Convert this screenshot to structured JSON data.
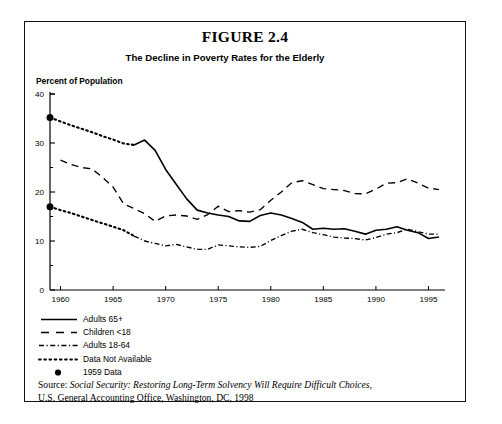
{
  "figure": {
    "title": "FIGURE 2.4",
    "subtitle": "The Decline in Poverty Rates for the Elderly",
    "y_axis_label": "Percent of Population"
  },
  "source": {
    "prefix": "Source: ",
    "italic_title": "Social Security: Restoring Long-Term Solvency Will Require Difficult Choices",
    "tail": ",",
    "line2": "U.S. General Accounting Office, Washington, DC, 1998"
  },
  "legend": {
    "items": [
      {
        "label": "Adults 65+",
        "style": "solid",
        "key": "line-solid-icon"
      },
      {
        "label": "Children <18",
        "style": "dashed",
        "key": "line-dashed-icon"
      },
      {
        "label": "Adults 18-64",
        "style": "dashdot",
        "key": "line-dashdot-icon"
      },
      {
        "label": "Data Not Available",
        "style": "dotted",
        "key": "line-dotted-icon"
      },
      {
        "label": "1959 Data",
        "style": "marker",
        "key": "filled-circle-icon"
      }
    ]
  },
  "chart_data": {
    "type": "line",
    "title": "The Decline in Poverty Rates for the Elderly",
    "xlabel": "",
    "ylabel": "Percent of Population",
    "xlim": [
      1959,
      1996
    ],
    "ylim": [
      0,
      40
    ],
    "yticks": [
      0,
      10,
      20,
      30,
      40
    ],
    "yticks_minor": [
      5,
      15,
      25,
      35
    ],
    "xticks": [
      1960,
      1965,
      1970,
      1975,
      1980,
      1985,
      1990,
      1995
    ],
    "grid": false,
    "legend_position": "below-axes-left",
    "markers": [
      {
        "name": "1959 Data - Adults 65+",
        "x": 1959,
        "y": 35.2
      },
      {
        "name": "1959 Data - Adults 18-64",
        "x": 1959,
        "y": 17.0
      }
    ],
    "series": [
      {
        "name": "Adults 65+",
        "style": "solid",
        "gap_style": "dotted",
        "gap_note": "1959-1966 interpolated, data not available",
        "x": [
          1959,
          1960,
          1961,
          1962,
          1963,
          1964,
          1965,
          1966,
          1967,
          1968,
          1969,
          1970,
          1971,
          1972,
          1973,
          1974,
          1975,
          1976,
          1977,
          1978,
          1979,
          1980,
          1981,
          1982,
          1983,
          1984,
          1985,
          1986,
          1987,
          1988,
          1989,
          1990,
          1991,
          1992,
          1993,
          1994,
          1995,
          1996
        ],
        "y": [
          35.2,
          34.4,
          33.6,
          32.9,
          32.2,
          31.4,
          30.7,
          29.9,
          29.6,
          30.6,
          28.5,
          24.6,
          21.6,
          18.6,
          16.3,
          15.7,
          15.3,
          15.0,
          14.1,
          14.0,
          15.2,
          15.7,
          15.3,
          14.6,
          13.8,
          12.4,
          12.6,
          12.4,
          12.5,
          12.0,
          11.4,
          12.2,
          12.4,
          12.9,
          12.2,
          11.7,
          10.5,
          10.8
        ]
      },
      {
        "name": "Children <18",
        "style": "dashed",
        "x": [
          1960,
          1961,
          1962,
          1963,
          1964,
          1965,
          1966,
          1967,
          1968,
          1969,
          1970,
          1971,
          1972,
          1973,
          1974,
          1975,
          1976,
          1977,
          1978,
          1979,
          1980,
          1981,
          1982,
          1983,
          1984,
          1985,
          1986,
          1987,
          1988,
          1989,
          1990,
          1991,
          1992,
          1993,
          1994,
          1995,
          1996
        ],
        "y": [
          26.5,
          25.6,
          25.0,
          24.7,
          23.0,
          21.0,
          17.6,
          16.6,
          15.6,
          14.0,
          15.1,
          15.3,
          15.1,
          14.4,
          15.4,
          17.1,
          16.0,
          16.2,
          15.9,
          16.4,
          18.3,
          20.0,
          21.9,
          22.3,
          21.5,
          20.7,
          20.5,
          20.3,
          19.7,
          19.6,
          20.6,
          21.8,
          21.9,
          22.7,
          21.8,
          20.8,
          20.5
        ]
      },
      {
        "name": "Adults 18-64",
        "style": "dashdot",
        "gap_style": "dotted",
        "gap_note": "1959-1966 interpolated, data not available",
        "x": [
          1959,
          1960,
          1961,
          1962,
          1963,
          1964,
          1965,
          1966,
          1967,
          1968,
          1969,
          1970,
          1971,
          1972,
          1973,
          1974,
          1975,
          1976,
          1977,
          1978,
          1979,
          1980,
          1981,
          1982,
          1983,
          1984,
          1985,
          1986,
          1987,
          1988,
          1989,
          1990,
          1991,
          1992,
          1993,
          1994,
          1995,
          1996
        ],
        "y": [
          17.0,
          16.3,
          15.7,
          15.0,
          14.3,
          13.6,
          12.9,
          12.2,
          11.0,
          10.0,
          9.5,
          9.0,
          9.3,
          8.8,
          8.3,
          8.3,
          9.2,
          9.0,
          8.8,
          8.7,
          8.9,
          10.1,
          11.1,
          12.0,
          12.4,
          11.7,
          11.3,
          10.8,
          10.6,
          10.5,
          10.2,
          10.7,
          11.4,
          11.7,
          12.4,
          11.9,
          11.4,
          11.4
        ]
      }
    ]
  }
}
